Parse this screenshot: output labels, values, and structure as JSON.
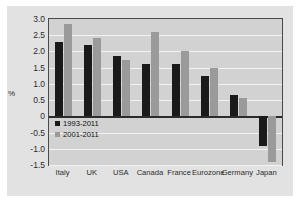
{
  "chart_data": {
    "type": "bar",
    "title": "",
    "subtitle": "",
    "xlabel": "",
    "ylabel": "%",
    "ylim": [
      -1.5,
      3.0
    ],
    "yticks": [
      "3.0",
      "2.5",
      "2.0",
      "1.5",
      "1.0",
      "0.5",
      "0",
      "-0.5",
      "-1.0",
      "-1.5"
    ],
    "ytick_values": [
      3.0,
      2.5,
      2.0,
      1.5,
      1.0,
      0.5,
      0,
      -0.5,
      -1.0,
      -1.5
    ],
    "grid": true,
    "grid_axis": "y",
    "legend_position": "lower-left-inside",
    "categories": [
      "Italy",
      "UK",
      "USA",
      "Canada",
      "France",
      "Eurozone",
      "Germany",
      "Japan"
    ],
    "series": [
      {
        "name": "1993-2011",
        "color": "#1a1a1a",
        "values": [
          2.3,
          2.2,
          1.85,
          1.6,
          1.6,
          1.25,
          0.65,
          -0.9
        ]
      },
      {
        "name": "2001-2011",
        "color": "#9a9a9a",
        "values": [
          2.85,
          2.4,
          1.75,
          2.6,
          2.0,
          1.5,
          0.55,
          -1.4
        ]
      }
    ]
  },
  "colors": {
    "series_1993": "#1a1a1a",
    "series_2001": "#9a9a9a",
    "figure_background": "#e2e2e2",
    "plot_background": "#d2d2d2",
    "gridline": "#f2f2f2",
    "axis": "#4a4a4a",
    "text": "#2b2b2b"
  }
}
